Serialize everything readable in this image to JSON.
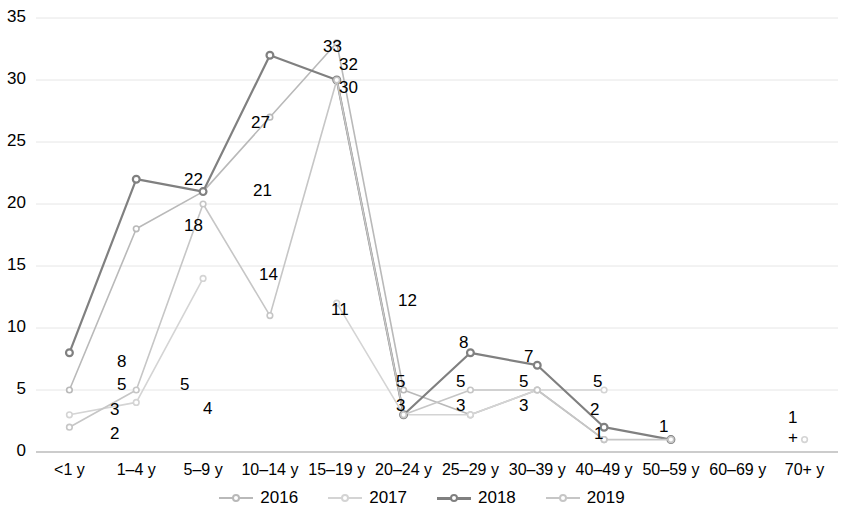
{
  "chart_data": {
    "type": "line",
    "title": "",
    "xlabel": "",
    "ylabel": "",
    "ylim": [
      0,
      35
    ],
    "yticks": [
      0,
      5,
      10,
      15,
      20,
      25,
      30,
      35
    ],
    "grid": true,
    "legend_position": "bottom",
    "categories": [
      "<1 y",
      "1–4 y",
      "5–9 y",
      "10–14 y",
      "15–19 y",
      "20–24 y",
      "25–29 y",
      "30–39 y",
      "40–49 y",
      "50–59 y",
      "60–69 y",
      "70+ y"
    ],
    "series": [
      {
        "name": "2016",
        "color": "#b9b9b9",
        "values": [
          5,
          18,
          21,
          27,
          33,
          5,
          3,
          5,
          1,
          null,
          null,
          null
        ]
      },
      {
        "name": "2017",
        "color": "#d4d4d4",
        "values": [
          3,
          4,
          14,
          null,
          12,
          3,
          3,
          5,
          5,
          null,
          null,
          1
        ]
      },
      {
        "name": "2018",
        "color": "#808080",
        "values": [
          8,
          22,
          21,
          32,
          30,
          3,
          8,
          7,
          2,
          1,
          null,
          null
        ]
      },
      {
        "name": "2019",
        "color": "#c6c6c6",
        "values": [
          2,
          5,
          20,
          11,
          30,
          3,
          5,
          5,
          1,
          1,
          null,
          null
        ]
      }
    ],
    "point_labels": [
      {
        "text": "8",
        "x": 117,
        "y": 352
      },
      {
        "text": "5",
        "x": 117,
        "y": 375
      },
      {
        "text": "3",
        "x": 110,
        "y": 400
      },
      {
        "text": "2",
        "x": 110,
        "y": 424
      },
      {
        "text": "22",
        "x": 184,
        "y": 170
      },
      {
        "text": "18",
        "x": 184,
        "y": 216
      },
      {
        "text": "5",
        "x": 180,
        "y": 375
      },
      {
        "text": "4",
        "x": 203,
        "y": 399
      },
      {
        "text": "21",
        "x": 253,
        "y": 181
      },
      {
        "text": "14",
        "x": 259,
        "y": 265
      },
      {
        "text": "27",
        "x": 251,
        "y": 113
      },
      {
        "text": "33",
        "x": 323,
        "y": 37
      },
      {
        "text": "32",
        "x": 339,
        "y": 55
      },
      {
        "text": "30",
        "x": 339,
        "y": 78
      },
      {
        "text": "11",
        "x": 331,
        "y": 300
      },
      {
        "text": "12",
        "x": 398,
        "y": 291
      },
      {
        "text": "5",
        "x": 396,
        "y": 372
      },
      {
        "text": "3",
        "x": 396,
        "y": 396
      },
      {
        "text": "8",
        "x": 459,
        "y": 333
      },
      {
        "text": "5",
        "x": 456,
        "y": 372
      },
      {
        "text": "3",
        "x": 456,
        "y": 396
      },
      {
        "text": "7",
        "x": 524,
        "y": 347
      },
      {
        "text": "5",
        "x": 519,
        "y": 372
      },
      {
        "text": "3",
        "x": 519,
        "y": 396
      },
      {
        "text": "5",
        "x": 593,
        "y": 372
      },
      {
        "text": "2",
        "x": 590,
        "y": 400
      },
      {
        "text": "1",
        "x": 594,
        "y": 424
      },
      {
        "text": "1",
        "x": 659,
        "y": 417
      },
      {
        "text": "1",
        "x": 788,
        "y": 408
      },
      {
        "text": "+",
        "x": 788,
        "y": 428
      }
    ]
  },
  "legend": {
    "items": [
      {
        "label": "2016"
      },
      {
        "label": "2017"
      },
      {
        "label": "2018"
      },
      {
        "label": "2019"
      }
    ]
  }
}
